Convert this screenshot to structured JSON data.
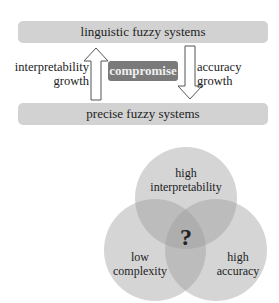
{
  "top_diagram": {
    "top_banner": "linguistic fuzzy systems",
    "bottom_banner": "precise fuzzy systems",
    "center_box": "compromise",
    "left_arrow_label": [
      "interpretability",
      "growth"
    ],
    "right_arrow_label": [
      "accuracy",
      "growth"
    ],
    "left_arrow_direction": "up",
    "right_arrow_direction": "down"
  },
  "venn": {
    "top_circle": [
      "high",
      "interpretability"
    ],
    "left_circle": [
      "low",
      "complexity"
    ],
    "right_circle": [
      "high",
      "accuracy"
    ],
    "center_mark": "?"
  },
  "colors": {
    "banner": "#d2d2d2",
    "compromise_box": "#7a7a7a",
    "circle_fill": "#bdbdbd"
  }
}
